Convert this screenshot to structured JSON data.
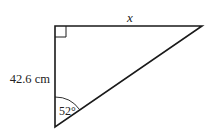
{
  "diagram": {
    "type": "right-triangle",
    "labels": {
      "top_side": "x",
      "left_side": "42.6 cm",
      "angle": "52°"
    },
    "colors": {
      "stroke": "#1a1a1a",
      "text": "#222222"
    }
  }
}
